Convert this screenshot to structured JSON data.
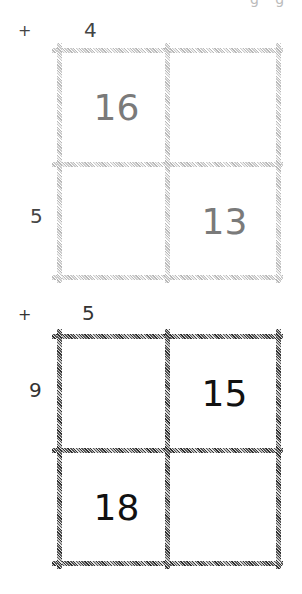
{
  "clipped_text_fragment": "g g",
  "puzzles": [
    {
      "style": "grey",
      "operator": "+",
      "col_labels": [
        "4",
        ""
      ],
      "row_labels": [
        "",
        "5"
      ],
      "cells": [
        [
          "16",
          ""
        ],
        [
          "",
          "13"
        ]
      ],
      "colors": {
        "line": "#c0c0c0",
        "cell_text": "#7a7a7a",
        "label_text": "#444444"
      }
    },
    {
      "style": "dark",
      "operator": "+",
      "col_labels": [
        "5",
        ""
      ],
      "row_labels": [
        "9",
        ""
      ],
      "cells": [
        [
          "",
          "15"
        ],
        [
          "18",
          ""
        ]
      ],
      "colors": {
        "line": "#444444",
        "cell_text": "#111111",
        "label_text": "#333333"
      }
    }
  ]
}
